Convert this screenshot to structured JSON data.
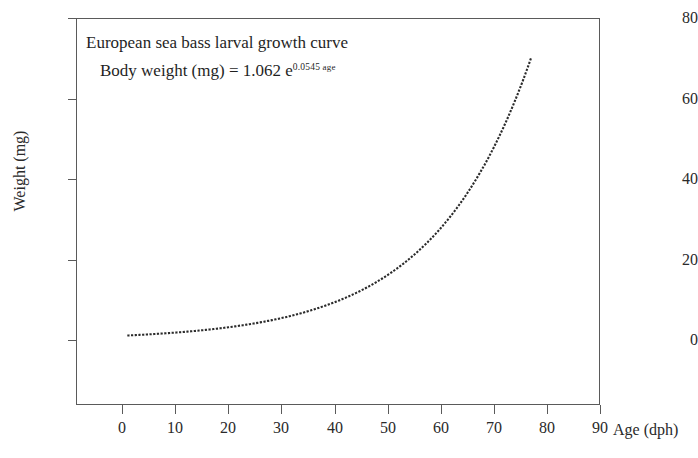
{
  "chart_data": {
    "type": "line",
    "title": "European sea bass larval growth curve",
    "equation_prefix": "Body weight (mg) = 1.062 e",
    "equation_exponent_coefficient": "0.0545",
    "equation_exponent_variable": "age",
    "model": "y = 1.062 * exp(0.0545 * x)",
    "xlabel": "Age (dph)",
    "ylabel": "Weight (mg)",
    "xlim": [
      0,
      90
    ],
    "ylim": [
      0,
      80
    ],
    "xticks": [
      "0",
      "10",
      "20",
      "30",
      "40",
      "50",
      "60",
      "70",
      "80",
      "90"
    ],
    "yticks": [
      "0",
      "20",
      "40",
      "60",
      "80"
    ],
    "grid": false,
    "legend": false,
    "line_style": "dotted",
    "line_color": "#2b2b2b",
    "series": [
      {
        "name": "Body weight (mg)",
        "x": [
          1,
          3,
          5,
          7,
          9,
          11,
          13,
          15,
          17,
          19,
          21,
          23,
          25,
          27,
          29,
          31,
          33,
          35,
          37,
          39,
          41,
          43,
          45,
          47,
          49,
          51,
          53,
          55,
          57,
          59,
          61,
          63,
          65,
          67,
          69,
          71,
          73,
          75,
          77
        ],
        "y": [
          1.12,
          1.25,
          1.4,
          1.56,
          1.74,
          1.94,
          2.16,
          2.41,
          2.68,
          2.99,
          3.33,
          3.72,
          4.14,
          4.62,
          5.15,
          5.74,
          6.4,
          7.14,
          7.96,
          8.87,
          9.89,
          11.03,
          12.29,
          13.7,
          15.28,
          17.03,
          18.99,
          21.17,
          23.6,
          26.31,
          29.33,
          32.7,
          36.46,
          40.65,
          45.31,
          50.52,
          56.32,
          62.79,
          70.0
        ]
      }
    ]
  },
  "axes": {
    "y_tick_labels": [
      "80",
      "60",
      "40",
      "20",
      "0"
    ],
    "x_tick_labels": [
      "0",
      "10",
      "20",
      "30",
      "40",
      "50",
      "60",
      "70",
      "80",
      "90"
    ],
    "y_title": "Weight (mg)",
    "x_title": "Age (dph)"
  },
  "annotation": {
    "line1": "European sea bass larval growth curve",
    "line2_prefix": "Body weight (mg) = 1.062 e",
    "line2_sup_number": "0.0545",
    "line2_sup_word": " age"
  },
  "colors": {
    "axis": "#5a5a5a",
    "text": "#2a2a2a",
    "curve": "#2b2b2b",
    "background": "#ffffff"
  }
}
